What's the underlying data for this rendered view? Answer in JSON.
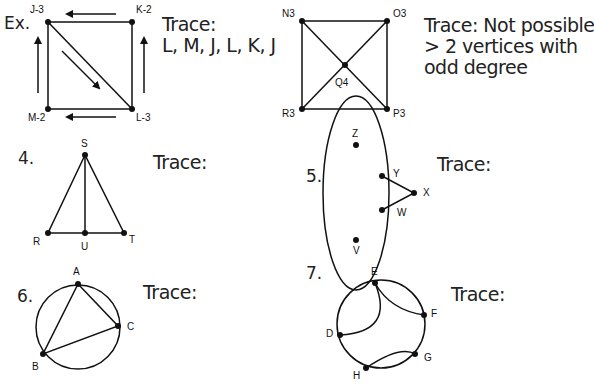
{
  "problems": {
    "example": {
      "number": "Ex.",
      "trace_label": "Trace:",
      "trace_answer": "L, M, J, L, K, J",
      "vertices": {
        "J": "J-3",
        "K": "K-2",
        "L": "L-3",
        "M": "M-2"
      }
    },
    "p3": {
      "trace_label": "Trace: Not possible",
      "trace_line2": "> 2 vertices with",
      "trace_line3": "odd degree",
      "vertices": {
        "N": "N3",
        "O": "O3",
        "P": "P3",
        "R": "R3",
        "Q": "Q4"
      }
    },
    "p4": {
      "number": "4.",
      "trace_label": "Trace:",
      "vertices": {
        "S": "S",
        "R": "R",
        "U": "U",
        "T": "T"
      }
    },
    "p5": {
      "number": "5.",
      "trace_label": "Trace:",
      "vertices": {
        "Z": "Z",
        "Y": "Y",
        "X": "X",
        "W": "W",
        "V": "V"
      }
    },
    "p6": {
      "number": "6.",
      "trace_label": "Trace:",
      "vertices": {
        "A": "A",
        "B": "B",
        "C": "C"
      }
    },
    "p7": {
      "number": "7.",
      "trace_label": "Trace:",
      "vertices": {
        "E": "E",
        "F": "F",
        "D": "D",
        "G": "G",
        "H": "H"
      }
    }
  }
}
